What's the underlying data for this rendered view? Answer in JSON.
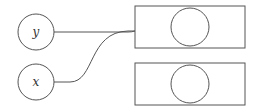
{
  "diagram": {
    "input_nodes": [
      {
        "id": "y",
        "label": "y",
        "cx": 36,
        "cy": 32,
        "r": 18
      },
      {
        "id": "x",
        "label": "x",
        "cx": 36,
        "cy": 82,
        "r": 18
      }
    ],
    "output_boxes": [
      {
        "x": 135,
        "y": 6,
        "w": 110,
        "h": 42,
        "inner_cx": 190,
        "inner_cy": 27,
        "inner_r": 19
      },
      {
        "x": 135,
        "y": 63,
        "w": 110,
        "h": 42,
        "inner_cx": 190,
        "inner_cy": 84,
        "inner_r": 19
      }
    ],
    "edges": [
      {
        "from": "y",
        "to": "box-1"
      },
      {
        "from": "x",
        "to": "box-1"
      }
    ],
    "colors": {
      "stroke": "#555555",
      "background": "#ffffff"
    }
  }
}
